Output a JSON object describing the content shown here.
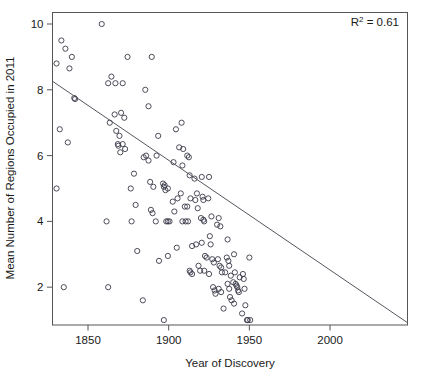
{
  "chart_data": {
    "type": "scatter",
    "title": "",
    "xlabel": "Year of Discovery",
    "ylabel": "Mean Number of Regions Occupied in 2011",
    "xlim": [
      1828,
      2048
    ],
    "ylim": [
      0.85,
      10.35
    ],
    "xticks": [
      1850,
      1900,
      1950,
      2000
    ],
    "xtick_labels": [
      "1850",
      "1900",
      "1950",
      "2000"
    ],
    "yticks": [
      2,
      4,
      6,
      8,
      10
    ],
    "ytick_labels": [
      "2",
      "4",
      "6",
      "8",
      "10"
    ],
    "grid": false,
    "legend": null,
    "annotations": [
      {
        "name": "r-squared",
        "text_prefix": "R",
        "text_sup": "2",
        "text_suffix": " = 0.61",
        "value": 0.61,
        "position": "top-right"
      }
    ],
    "trendline": {
      "type": "linear-fit",
      "x_start": 1828,
      "y_start": 8.26,
      "x_end": 2048,
      "y_end": 0.92,
      "slope_per_year": -0.0334,
      "color": "#555560"
    },
    "marker": {
      "shape": "open-circle",
      "radius": 2.6,
      "color": "#3a3a4a"
    },
    "points": [
      [
        1830.5,
        8.8
      ],
      [
        1833.5,
        9.5
      ],
      [
        1836.0,
        9.25
      ],
      [
        1840.0,
        9.0
      ],
      [
        1838.5,
        8.65
      ],
      [
        1832.5,
        6.8
      ],
      [
        1837.5,
        6.4
      ],
      [
        1841.5,
        7.75
      ],
      [
        1842.0,
        7.72
      ],
      [
        1830.5,
        5.0
      ],
      [
        1835.0,
        2.0
      ],
      [
        1858.5,
        10.0
      ],
      [
        1862.5,
        8.2
      ],
      [
        1864.5,
        8.4
      ],
      [
        1867.0,
        8.2
      ],
      [
        1871.5,
        8.2
      ],
      [
        1874.5,
        9.0
      ],
      [
        1863.5,
        7.0
      ],
      [
        1866.5,
        7.25
      ],
      [
        1870.5,
        7.3
      ],
      [
        1872.5,
        7.15
      ],
      [
        1867.5,
        6.75
      ],
      [
        1869.5,
        6.6
      ],
      [
        1868.5,
        6.35
      ],
      [
        1868.8,
        6.3
      ],
      [
        1870.0,
        6.1
      ],
      [
        1871.5,
        6.35
      ],
      [
        1873.0,
        6.2
      ],
      [
        1861.5,
        4.0
      ],
      [
        1862.5,
        2.0
      ],
      [
        1878.5,
        5.45
      ],
      [
        1876.5,
        5.0
      ],
      [
        1879.5,
        4.5
      ],
      [
        1877.0,
        4.0
      ],
      [
        1880.5,
        3.1
      ],
      [
        1884.0,
        1.6
      ],
      [
        1885.5,
        8.0
      ],
      [
        1887.5,
        7.5
      ],
      [
        1889.5,
        9.0
      ],
      [
        1886.0,
        6.0
      ],
      [
        1887.5,
        5.85
      ],
      [
        1884.5,
        5.95
      ],
      [
        1888.5,
        5.2
      ],
      [
        1890.5,
        5.05
      ],
      [
        1889.0,
        4.35
      ],
      [
        1890.0,
        4.25
      ],
      [
        1892.5,
        6.0
      ],
      [
        1893.5,
        6.6
      ],
      [
        1892.0,
        4.0
      ],
      [
        1894.0,
        2.8
      ],
      [
        1896.5,
        5.15
      ],
      [
        1897.5,
        5.1
      ],
      [
        1897.0,
        5.05
      ],
      [
        1898.0,
        4.95
      ],
      [
        1899.5,
        5.0
      ],
      [
        1898.5,
        4.0
      ],
      [
        1899.5,
        4.0
      ],
      [
        1900.5,
        4.0
      ],
      [
        1897.0,
        1.0
      ],
      [
        1899.5,
        2.95
      ],
      [
        1903.0,
        5.8
      ],
      [
        1904.5,
        6.8
      ],
      [
        1902.5,
        4.6
      ],
      [
        1903.5,
        4.3
      ],
      [
        1905.5,
        4.7
      ],
      [
        1905.0,
        3.2
      ],
      [
        1908.0,
        7.0
      ],
      [
        1906.5,
        6.25
      ],
      [
        1909.0,
        6.2
      ],
      [
        1908.5,
        5.7
      ],
      [
        1907.5,
        4.85
      ],
      [
        1910.0,
        4.45
      ],
      [
        1908.5,
        4.0
      ],
      [
        1910.5,
        4.0
      ],
      [
        1911.5,
        6.0
      ],
      [
        1912.5,
        5.95
      ],
      [
        1913.0,
        5.4
      ],
      [
        1911.5,
        4.45
      ],
      [
        1913.5,
        4.7
      ],
      [
        1912.0,
        4.0
      ],
      [
        1914.5,
        3.25
      ],
      [
        1913.0,
        2.5
      ],
      [
        1913.5,
        2.45
      ],
      [
        1914.5,
        2.4
      ],
      [
        1916.0,
        5.3
      ],
      [
        1917.5,
        4.85
      ],
      [
        1916.5,
        4.65
      ],
      [
        1918.0,
        4.4
      ],
      [
        1917.0,
        3.3
      ],
      [
        1918.5,
        2.65
      ],
      [
        1919.5,
        2.5
      ],
      [
        1920.5,
        5.35
      ],
      [
        1921.0,
        4.75
      ],
      [
        1921.5,
        4.65
      ],
      [
        1920.0,
        4.1
      ],
      [
        1921.5,
        4.05
      ],
      [
        1922.0,
        4.0
      ],
      [
        1920.5,
        3.35
      ],
      [
        1922.5,
        2.95
      ],
      [
        1923.5,
        2.9
      ],
      [
        1922.0,
        2.5
      ],
      [
        1925.0,
        5.35
      ],
      [
        1924.5,
        4.7
      ],
      [
        1926.5,
        4.15
      ],
      [
        1925.5,
        3.55
      ],
      [
        1926.0,
        3.3
      ],
      [
        1927.0,
        2.85
      ],
      [
        1928.0,
        2.75
      ],
      [
        1925.0,
        2.4
      ],
      [
        1927.5,
        2.0
      ],
      [
        1928.5,
        1.9
      ],
      [
        1929.0,
        1.8
      ],
      [
        1931.0,
        4.1
      ],
      [
        1930.0,
        3.9
      ],
      [
        1932.0,
        3.85
      ],
      [
        1930.5,
        2.85
      ],
      [
        1931.5,
        2.65
      ],
      [
        1932.5,
        2.6
      ],
      [
        1933.0,
        2.45
      ],
      [
        1931.0,
        1.95
      ],
      [
        1932.5,
        1.85
      ],
      [
        1934.0,
        1.35
      ],
      [
        1936.5,
        3.45
      ],
      [
        1936.0,
        2.9
      ],
      [
        1937.0,
        2.8
      ],
      [
        1937.5,
        2.65
      ],
      [
        1935.0,
        2.45
      ],
      [
        1936.5,
        2.1
      ],
      [
        1937.5,
        1.95
      ],
      [
        1938.0,
        1.7
      ],
      [
        1939.0,
        1.6
      ],
      [
        1938.5,
        2.35
      ],
      [
        1940.5,
        3.0
      ],
      [
        1941.0,
        2.45
      ],
      [
        1940.0,
        2.15
      ],
      [
        1941.5,
        2.1
      ],
      [
        1942.0,
        2.05
      ],
      [
        1942.5,
        2.0
      ],
      [
        1940.5,
        1.5
      ],
      [
        1943.0,
        1.9
      ],
      [
        1943.5,
        1.85
      ],
      [
        1944.0,
        2.3
      ],
      [
        1946.0,
        2.4
      ],
      [
        1946.5,
        2.25
      ],
      [
        1947.0,
        1.95
      ],
      [
        1945.5,
        1.2
      ],
      [
        1947.5,
        1.45
      ],
      [
        1948.5,
        1.0
      ],
      [
        1949.0,
        1.0
      ],
      [
        1950.5,
        1.0
      ],
      [
        1950.0,
        2.9
      ]
    ]
  },
  "axis": {
    "x_title": "Year of Discovery",
    "y_title": "Mean Number of Regions Occupied in 2011"
  },
  "annotation": {
    "r_prefix": "R",
    "r_sup": "2",
    "r_rest": " = 0.61"
  },
  "colors": {
    "marker_stroke": "#3a3a4a",
    "line": "#555560",
    "frame": "#555555",
    "text": "#1a1a1a",
    "background": "#ffffff"
  }
}
